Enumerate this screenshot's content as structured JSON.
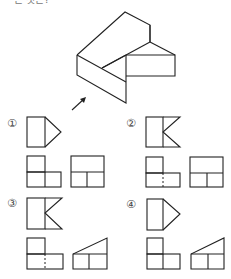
{
  "question": {
    "cut_off_text": "은 것은?"
  },
  "isometric_object": {
    "description": "3D block with stepped top and rectangular extension; arrow indicates front viewing direction",
    "arrow_label": "front-view-direction"
  },
  "options": [
    {
      "label": "①",
      "front_view": "rect+triangle",
      "top_view": "L-shape solid divider",
      "side_view": "rect with T divider"
    },
    {
      "label": "②",
      "front_view": "rect+K notch",
      "top_view": "L-shape dashed divider",
      "side_view": "rect with T divider"
    },
    {
      "label": "③",
      "front_view": "rect+K notch",
      "top_view": "L-shape dashed divider",
      "side_view": "trapezoid with T divider"
    },
    {
      "label": "④",
      "front_view": "rect+triangle",
      "top_view": "L-shape solid divider",
      "side_view": "trapezoid with T divider"
    }
  ],
  "colors": {
    "line": "#222222",
    "label": "#444444",
    "background": "#ffffff"
  }
}
